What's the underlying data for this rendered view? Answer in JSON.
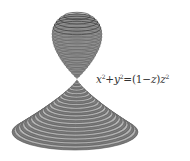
{
  "figure": {
    "stroke_color": "#555555",
    "fill_color": "#9a9a9a",
    "upper_lobe": {
      "rings": 14,
      "cx": 77,
      "top_y": 13,
      "apex_y": 79,
      "max_half_width": 25
    },
    "lower_cone": {
      "rings": 38,
      "apex": [
        77,
        79
      ],
      "base_center": [
        75,
        132
      ],
      "base_rx": 63,
      "base_ry": 18
    }
  },
  "equation": {
    "x": "x",
    "x_exp": "2",
    "plus": "+",
    "y": "y",
    "y_exp": "2",
    "equals": "=",
    "paren_open": "(",
    "one": "1",
    "minus": "−",
    "z": "z",
    "paren_close": ")",
    "z2": "z",
    "z_exp": "2"
  }
}
